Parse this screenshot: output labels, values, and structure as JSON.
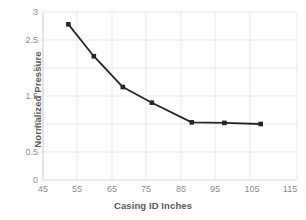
{
  "chart_data": {
    "type": "line",
    "title": "",
    "xlabel": "Casing ID Inches",
    "ylabel": "Normalized Pressure",
    "xlim": [
      45,
      115
    ],
    "ylim": [
      0,
      3
    ],
    "xticks": [
      45,
      55,
      65,
      75,
      85,
      95,
      105,
      115
    ],
    "yticks": [
      0,
      0.5,
      1,
      1.5,
      2,
      2.5,
      3
    ],
    "grid": true,
    "legend": null,
    "series": [
      {
        "name": "Normalized Pressure",
        "marker": "square",
        "color": "#262626",
        "x": [
          52,
          59,
          67,
          75,
          86,
          95,
          105
        ],
        "y": [
          2.78,
          2.21,
          1.66,
          1.38,
          1.03,
          1.02,
          1.0
        ]
      }
    ]
  },
  "axes": {
    "y_title": "Normalized Pressure",
    "x_title": "Casing ID Inches",
    "y_tick_labels": [
      "3",
      "2.5",
      "2",
      "1.5",
      "1",
      "0.5",
      "0"
    ],
    "x_tick_labels": [
      "45",
      "55",
      "65",
      "75",
      "85",
      "95",
      "105",
      "115"
    ]
  },
  "style": {
    "line_color": "#262626",
    "marker_color": "#262626",
    "grid_color": "#e8e8e8",
    "axis_color": "#d9d9d9",
    "tick_text_color": "#8c8c8c",
    "title_text_color": "#595959",
    "background": "#ffffff"
  }
}
